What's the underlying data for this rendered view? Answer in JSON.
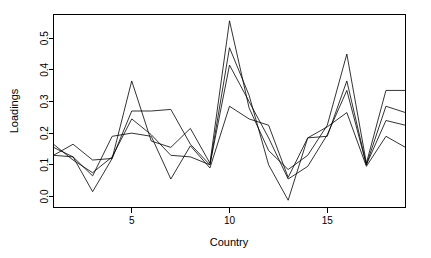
{
  "chart_data": {
    "type": "line",
    "title": "",
    "xlabel": "Country",
    "ylabel": "Loadings",
    "xlim": [
      1,
      19
    ],
    "ylim": [
      -0.035,
      0.575
    ],
    "grid": false,
    "legend": "none",
    "x": [
      1,
      2,
      3,
      4,
      5,
      6,
      7,
      8,
      9,
      10,
      11,
      12,
      13,
      14,
      15,
      16,
      17,
      18,
      19
    ],
    "xticks": [
      5,
      10,
      15
    ],
    "xticklabels": [
      "5",
      "10",
      "15"
    ],
    "yticks": [
      0.0,
      0.1,
      0.2,
      0.3,
      0.4,
      0.5
    ],
    "yticklabels": [
      "0.0",
      "0.1",
      "0.2",
      "0.3",
      "0.4",
      "0.5"
    ],
    "series": [
      {
        "name": "Factor 1",
        "values": [
          0.13,
          0.165,
          0.115,
          0.12,
          0.365,
          0.175,
          0.155,
          0.215,
          0.105,
          0.555,
          0.28,
          0.145,
          0.085,
          0.13,
          0.225,
          0.45,
          0.105,
          0.335,
          0.335
        ]
      },
      {
        "name": "Factor 2",
        "values": [
          0.155,
          0.125,
          0.015,
          0.12,
          0.27,
          0.27,
          0.275,
          0.165,
          0.1,
          0.47,
          0.32,
          0.1,
          -0.012,
          0.185,
          0.19,
          0.365,
          0.1,
          0.285,
          0.265
        ]
      },
      {
        "name": "Factor 3",
        "values": [
          0.165,
          0.115,
          0.075,
          0.125,
          0.245,
          0.195,
          0.13,
          0.125,
          0.1,
          0.415,
          0.3,
          0.185,
          0.055,
          0.095,
          0.195,
          0.335,
          0.1,
          0.24,
          0.225
        ]
      },
      {
        "name": "Factor 4",
        "values": [
          0.13,
          0.125,
          0.065,
          0.19,
          0.2,
          0.19,
          0.055,
          0.16,
          0.09,
          0.285,
          0.245,
          0.225,
          0.06,
          0.185,
          0.22,
          0.265,
          0.095,
          0.19,
          0.155
        ]
      }
    ]
  },
  "axes": {
    "x_label": "Country",
    "y_label": "Loadings"
  },
  "colors": {
    "line": "#000000",
    "axis": "#000000",
    "background": "#ffffff"
  }
}
